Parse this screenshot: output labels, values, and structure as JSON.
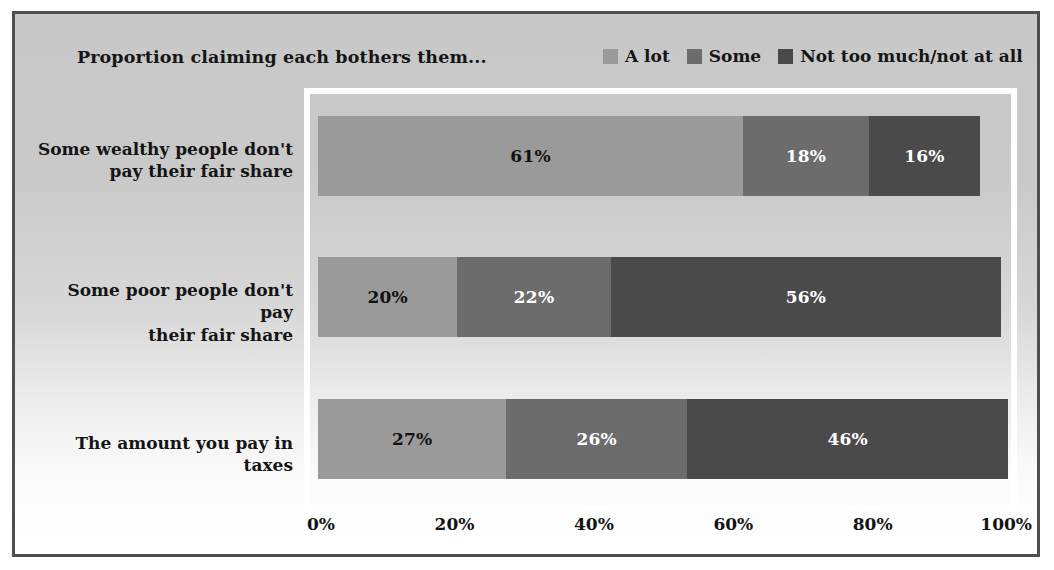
{
  "chart_data": {
    "type": "bar",
    "subtype": "horizontal-stacked-100",
    "title": "Proportion claiming each bothers them...",
    "xlabel": "",
    "ylabel": "",
    "xlim": [
      0,
      100
    ],
    "grid": false,
    "legend_position": "top-right",
    "categories": [
      "Some wealthy people don't pay their fair share",
      "Some poor people don't pay their fair share",
      "The amount you pay in taxes"
    ],
    "category_lines": [
      [
        "Some wealthy people don't",
        "pay their fair share"
      ],
      [
        "Some poor people don't pay",
        "their fair share"
      ],
      [
        "The amount you pay in taxes"
      ]
    ],
    "series": [
      {
        "name": "A lot",
        "color": "#9a9a9a",
        "label_color": "#111111",
        "values": [
          61,
          20,
          27
        ],
        "labels": [
          "61%",
          "20%",
          "27%"
        ]
      },
      {
        "name": "Some",
        "color": "#6c6c6c",
        "label_color": "#ffffff",
        "values": [
          18,
          22,
          26
        ],
        "labels": [
          "18%",
          "22%",
          "26%"
        ]
      },
      {
        "name": "Not too much/not at all",
        "color": "#4a4a4a",
        "label_color": "#ffffff",
        "values": [
          16,
          56,
          46
        ],
        "labels": [
          "16%",
          "56%",
          "46%"
        ]
      }
    ],
    "xticks": [
      0,
      20,
      40,
      60,
      80,
      100
    ],
    "xtick_labels": [
      "0%",
      "20%",
      "40%",
      "60%",
      "80%",
      "100%"
    ]
  },
  "legend": {
    "items": [
      {
        "label": "A lot",
        "color": "#9a9a9a"
      },
      {
        "label": "Some",
        "color": "#6c6c6c"
      },
      {
        "label": "Not too much/not at all",
        "color": "#4a4a4a"
      }
    ]
  },
  "colors": {
    "a_lot": "#9a9a9a",
    "some": "#6c6c6c",
    "not_too_much": "#4a4a4a",
    "frame_border": "#4f4f4f",
    "plot_border": "#ffffff",
    "text": "#141414"
  }
}
